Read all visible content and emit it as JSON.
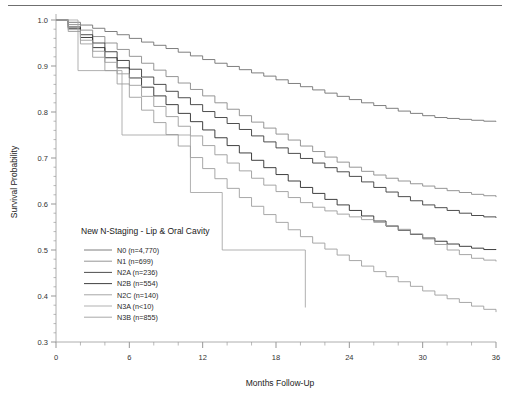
{
  "chart_data": {
    "type": "line",
    "title": "",
    "xlabel": "Months Follow-Up",
    "ylabel": "Survival Probability",
    "xlim": [
      0,
      36
    ],
    "ylim": [
      0.3,
      1.0
    ],
    "xticks": [
      0,
      6,
      12,
      18,
      24,
      30,
      36
    ],
    "xtick_labels": [
      "0",
      "6",
      "12",
      "18",
      "24",
      "30",
      "36"
    ],
    "xtick_minor_step": 2,
    "yticks": [
      0.3,
      0.4,
      0.5,
      0.6,
      0.7,
      0.8,
      0.9,
      1.0
    ],
    "ytick_labels": [
      "0.3",
      "0.4",
      "0.5",
      "0.6",
      "0.7",
      "0.8",
      "0.9",
      "1.0"
    ],
    "grid": false,
    "legend_position": "lower-left-inside",
    "legend_title": "New N-Staging - Lip & Oral Cavity",
    "series": [
      {
        "name": "N0",
        "label": "N0 (n=4,770)",
        "n": "4,770",
        "color": "#707070",
        "final_value": 0.78,
        "points": [
          [
            0,
            1.0
          ],
          [
            1,
            0.995
          ],
          [
            2,
            0.989
          ],
          [
            3,
            0.982
          ],
          [
            4,
            0.975
          ],
          [
            5,
            0.968
          ],
          [
            6,
            0.96
          ],
          [
            7,
            0.952
          ],
          [
            8,
            0.945
          ],
          [
            9,
            0.938
          ],
          [
            10,
            0.93
          ],
          [
            11,
            0.922
          ],
          [
            12,
            0.914
          ],
          [
            13,
            0.906
          ],
          [
            14,
            0.899
          ],
          [
            15,
            0.892
          ],
          [
            16,
            0.885
          ],
          [
            17,
            0.878
          ],
          [
            18,
            0.87
          ],
          [
            19,
            0.862
          ],
          [
            20,
            0.855
          ],
          [
            21,
            0.848
          ],
          [
            22,
            0.841
          ],
          [
            23,
            0.834
          ],
          [
            24,
            0.827
          ],
          [
            25,
            0.82
          ],
          [
            26,
            0.814
          ],
          [
            27,
            0.808
          ],
          [
            28,
            0.802
          ],
          [
            29,
            0.797
          ],
          [
            30,
            0.792
          ],
          [
            31,
            0.788
          ],
          [
            32,
            0.786
          ],
          [
            33,
            0.784
          ],
          [
            34,
            0.782
          ],
          [
            35,
            0.78
          ],
          [
            36,
            0.779
          ]
        ]
      },
      {
        "name": "N1",
        "label": "N1 (n=699)",
        "n": "699",
        "color": "#8a8a8a",
        "final_value": 0.615,
        "points": [
          [
            0,
            1.0
          ],
          [
            1,
            0.99
          ],
          [
            2,
            0.978
          ],
          [
            3,
            0.964
          ],
          [
            4,
            0.95
          ],
          [
            5,
            0.936
          ],
          [
            6,
            0.921
          ],
          [
            7,
            0.906
          ],
          [
            8,
            0.891
          ],
          [
            9,
            0.877
          ],
          [
            10,
            0.863
          ],
          [
            11,
            0.849
          ],
          [
            12,
            0.835
          ],
          [
            13,
            0.82
          ],
          [
            14,
            0.806
          ],
          [
            15,
            0.792
          ],
          [
            16,
            0.778
          ],
          [
            17,
            0.765
          ],
          [
            18,
            0.752
          ],
          [
            19,
            0.739
          ],
          [
            20,
            0.726
          ],
          [
            21,
            0.714
          ],
          [
            22,
            0.702
          ],
          [
            23,
            0.691
          ],
          [
            24,
            0.68
          ],
          [
            25,
            0.671
          ],
          [
            26,
            0.663
          ],
          [
            27,
            0.656
          ],
          [
            28,
            0.65
          ],
          [
            29,
            0.644
          ],
          [
            30,
            0.639
          ],
          [
            31,
            0.634
          ],
          [
            32,
            0.629
          ],
          [
            33,
            0.625
          ],
          [
            34,
            0.621
          ],
          [
            35,
            0.618
          ],
          [
            36,
            0.615
          ]
        ]
      },
      {
        "name": "N2A",
        "label": "N2A (n=236)",
        "n": "236",
        "color": "#3a3a3a",
        "final_value": 0.57,
        "points": [
          [
            0,
            1.0
          ],
          [
            1,
            0.985
          ],
          [
            2,
            0.968
          ],
          [
            3,
            0.95
          ],
          [
            4,
            0.931
          ],
          [
            5,
            0.912
          ],
          [
            6,
            0.893
          ],
          [
            7,
            0.876
          ],
          [
            8,
            0.86
          ],
          [
            9,
            0.845
          ],
          [
            10,
            0.831
          ],
          [
            11,
            0.816
          ],
          [
            12,
            0.801
          ],
          [
            13,
            0.788
          ],
          [
            14,
            0.775
          ],
          [
            15,
            0.762
          ],
          [
            16,
            0.748
          ],
          [
            17,
            0.735
          ],
          [
            18,
            0.722
          ],
          [
            19,
            0.71
          ],
          [
            20,
            0.699
          ],
          [
            21,
            0.689
          ],
          [
            22,
            0.679
          ],
          [
            23,
            0.67
          ],
          [
            24,
            0.66
          ],
          [
            25,
            0.648
          ],
          [
            26,
            0.636
          ],
          [
            27,
            0.626
          ],
          [
            28,
            0.616
          ],
          [
            29,
            0.607
          ],
          [
            30,
            0.598
          ],
          [
            31,
            0.592
          ],
          [
            32,
            0.586
          ],
          [
            33,
            0.58
          ],
          [
            34,
            0.575
          ],
          [
            35,
            0.572
          ],
          [
            36,
            0.57
          ]
        ]
      },
      {
        "name": "N2B",
        "label": "N2B (n=554)",
        "n": "554",
        "color": "#2b2b2b",
        "final_value": 0.5,
        "points": [
          [
            0,
            1.0
          ],
          [
            1,
            0.982
          ],
          [
            2,
            0.962
          ],
          [
            3,
            0.94
          ],
          [
            4,
            0.918
          ],
          [
            5,
            0.896
          ],
          [
            6,
            0.874
          ],
          [
            7,
            0.854
          ],
          [
            8,
            0.835
          ],
          [
            9,
            0.816
          ],
          [
            10,
            0.797
          ],
          [
            11,
            0.779
          ],
          [
            12,
            0.761
          ],
          [
            13,
            0.744
          ],
          [
            14,
            0.727
          ],
          [
            15,
            0.711
          ],
          [
            16,
            0.695
          ],
          [
            17,
            0.679
          ],
          [
            18,
            0.664
          ],
          [
            19,
            0.65
          ],
          [
            20,
            0.636
          ],
          [
            21,
            0.623
          ],
          [
            22,
            0.61
          ],
          [
            23,
            0.598
          ],
          [
            24,
            0.586
          ],
          [
            25,
            0.574
          ],
          [
            26,
            0.563
          ],
          [
            27,
            0.552
          ],
          [
            28,
            0.543
          ],
          [
            29,
            0.534
          ],
          [
            30,
            0.526
          ],
          [
            31,
            0.519
          ],
          [
            32,
            0.513
          ],
          [
            33,
            0.508
          ],
          [
            34,
            0.504
          ],
          [
            35,
            0.501
          ],
          [
            36,
            0.5
          ]
        ]
      },
      {
        "name": "N2C",
        "label": "N2C (n=140)",
        "n": "140",
        "color": "#9c9c9c",
        "final_value": 0.475,
        "points": [
          [
            0,
            1.0
          ],
          [
            1,
            0.979
          ],
          [
            2,
            0.956
          ],
          [
            3,
            0.932
          ],
          [
            4,
            0.908
          ],
          [
            5,
            0.883
          ],
          [
            6,
            0.858
          ],
          [
            7,
            0.834
          ],
          [
            8,
            0.812
          ],
          [
            9,
            0.79
          ],
          [
            10,
            0.769
          ],
          [
            11,
            0.748
          ],
          [
            12,
            0.727
          ],
          [
            13,
            0.707
          ],
          [
            14,
            0.689
          ],
          [
            15,
            0.672
          ],
          [
            16,
            0.656
          ],
          [
            17,
            0.641
          ],
          [
            18,
            0.627
          ],
          [
            19,
            0.614
          ],
          [
            20,
            0.603
          ],
          [
            21,
            0.593
          ],
          [
            22,
            0.585
          ],
          [
            23,
            0.578
          ],
          [
            24,
            0.572
          ],
          [
            25,
            0.566
          ],
          [
            26,
            0.56
          ],
          [
            27,
            0.553
          ],
          [
            28,
            0.545
          ],
          [
            29,
            0.535
          ],
          [
            30,
            0.524
          ],
          [
            31,
            0.512
          ],
          [
            32,
            0.5
          ],
          [
            33,
            0.49
          ],
          [
            34,
            0.482
          ],
          [
            35,
            0.478
          ],
          [
            36,
            0.475
          ]
        ]
      },
      {
        "name": "N3A",
        "label": "N3A (n<10)",
        "n": "<10",
        "color": "#a8a8a8",
        "final_value": 0.375,
        "step": true,
        "points": [
          [
            0,
            1.0
          ],
          [
            1.8,
            1.0
          ],
          [
            1.8,
            0.89
          ],
          [
            5.4,
            0.89
          ],
          [
            5.4,
            0.75
          ],
          [
            11.0,
            0.75
          ],
          [
            11.0,
            0.625
          ],
          [
            13.6,
            0.625
          ],
          [
            13.6,
            0.5
          ],
          [
            20.4,
            0.5
          ],
          [
            20.4,
            0.375
          ]
        ]
      },
      {
        "name": "N3B",
        "label": "N3B (n=855)",
        "n": "855",
        "color": "#9e9e9e",
        "final_value": 0.365,
        "points": [
          [
            0,
            1.0
          ],
          [
            1,
            0.975
          ],
          [
            2,
            0.948
          ],
          [
            3,
            0.919
          ],
          [
            4,
            0.89
          ],
          [
            5,
            0.861
          ],
          [
            6,
            0.832
          ],
          [
            7,
            0.804
          ],
          [
            8,
            0.777
          ],
          [
            9,
            0.751
          ],
          [
            10,
            0.726
          ],
          [
            11,
            0.701
          ],
          [
            12,
            0.677
          ],
          [
            13,
            0.655
          ],
          [
            14,
            0.634
          ],
          [
            15,
            0.614
          ],
          [
            16,
            0.595
          ],
          [
            17,
            0.577
          ],
          [
            18,
            0.56
          ],
          [
            19,
            0.544
          ],
          [
            20,
            0.529
          ],
          [
            21,
            0.515
          ],
          [
            22,
            0.502
          ],
          [
            23,
            0.489
          ],
          [
            24,
            0.477
          ],
          [
            25,
            0.465
          ],
          [
            26,
            0.453
          ],
          [
            27,
            0.442
          ],
          [
            28,
            0.431
          ],
          [
            29,
            0.421
          ],
          [
            30,
            0.411
          ],
          [
            31,
            0.402
          ],
          [
            32,
            0.394
          ],
          [
            33,
            0.386
          ],
          [
            34,
            0.378
          ],
          [
            35,
            0.371
          ],
          [
            36,
            0.365
          ]
        ]
      }
    ]
  }
}
